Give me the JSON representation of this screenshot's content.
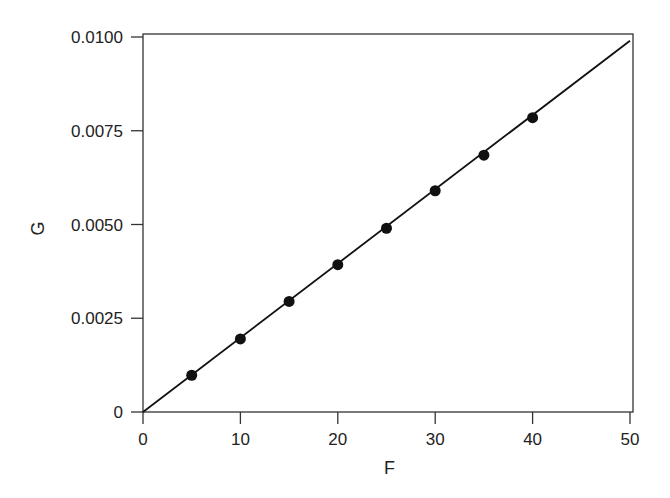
{
  "chart_data": {
    "type": "scatter",
    "title": "",
    "xlabel": "F",
    "ylabel": "G",
    "xlim": [
      0,
      50
    ],
    "ylim": [
      0,
      0.01
    ],
    "grid": false,
    "legend": null,
    "x_ticks": [
      "0",
      "10",
      "20",
      "30",
      "40",
      "50"
    ],
    "y_ticks": [
      "0",
      "0.0025",
      "0.0050",
      "0.0075",
      "0.0100"
    ],
    "series": [
      {
        "name": "data points",
        "style": "filled circle markers",
        "x": [
          5,
          10,
          15,
          20,
          25,
          30,
          35,
          40
        ],
        "y": [
          0.00098,
          0.00195,
          0.00295,
          0.00393,
          0.0049,
          0.0059,
          0.00685,
          0.00785
        ]
      },
      {
        "name": "fit line",
        "style": "solid line",
        "x": [
          0,
          50
        ],
        "y": [
          0,
          0.0099
        ]
      }
    ]
  }
}
